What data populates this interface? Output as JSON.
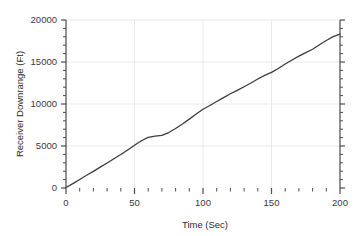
{
  "chart_data": {
    "type": "line",
    "title": "",
    "xlabel": "Time (Sec)",
    "ylabel": "Receiver Downrange (Ft)",
    "xlim": [
      0,
      200
    ],
    "ylim": [
      0,
      20000
    ],
    "grid": true,
    "legend": false,
    "x_ticks": [
      0,
      50,
      100,
      150,
      200
    ],
    "x_tick_labels": [
      "0",
      "50",
      "100",
      "150",
      "200"
    ],
    "x_minor_step": 10,
    "y_ticks": [
      0,
      5000,
      10000,
      15000,
      20000
    ],
    "y_tick_labels": [
      "0",
      "5000",
      "10000",
      "15000",
      "20000"
    ],
    "y_minor_step": 1000,
    "line_color": "#3b3b3b",
    "grid_color": "#e9e9e9",
    "axis_color": "#4a4a4a",
    "series": [
      {
        "name": "Receiver Downrange",
        "x": [
          0,
          5,
          10,
          15,
          20,
          25,
          30,
          35,
          40,
          45,
          50,
          55,
          60,
          65,
          70,
          75,
          80,
          85,
          90,
          95,
          100,
          105,
          110,
          115,
          120,
          125,
          130,
          135,
          140,
          145,
          150,
          155,
          160,
          165,
          170,
          175,
          180,
          185,
          190,
          195,
          200
        ],
        "y": [
          60,
          520,
          1020,
          1520,
          1980,
          2480,
          2980,
          3480,
          3980,
          4520,
          5080,
          5620,
          6020,
          6180,
          6260,
          6600,
          7080,
          7620,
          8200,
          8800,
          9380,
          9820,
          10300,
          10760,
          11220,
          11620,
          12060,
          12500,
          12980,
          13400,
          13760,
          14220,
          14760,
          15240,
          15700,
          16120,
          16520,
          17060,
          17560,
          18020,
          18320
        ]
      }
    ]
  }
}
